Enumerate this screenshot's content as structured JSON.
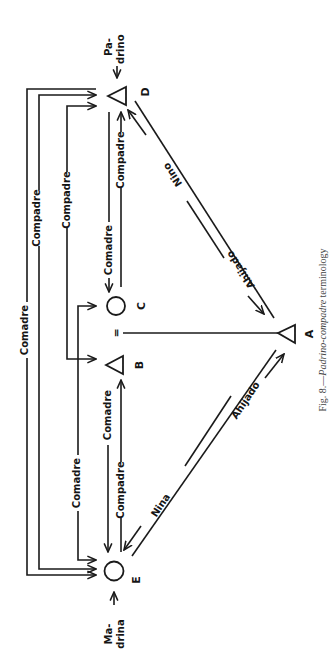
{
  "figure": {
    "caption_prefix": "Fig. 8.—",
    "caption_italic": "Padrino-compadre",
    "caption_suffix": " terminology"
  },
  "nodes": {
    "A": {
      "label": "A",
      "shape": "triangle"
    },
    "B": {
      "label": "B",
      "shape": "triangle"
    },
    "C": {
      "label": "C",
      "shape": "circle"
    },
    "D": {
      "label": "D",
      "shape": "triangle",
      "role_line1": "Pa-",
      "role_line2": "drino"
    },
    "E": {
      "label": "E",
      "shape": "circle",
      "role_line1": "Ma-",
      "role_line2": "drina"
    }
  },
  "marriage_symbol": "=",
  "edges": {
    "d_e_outer": "Comadre",
    "d_e_middle": "Compadre",
    "d_b": "Compadre",
    "c_e": "Comadre",
    "c_d": "Comadre",
    "d_c": "Compadre",
    "b_e_comadre": "Comadre",
    "e_b_compadre": "Compadre",
    "d_a_nino": "Nino",
    "a_d_ahijado": "Ahijado",
    "e_a_nina": "Nina",
    "a_e_ahijado": "Ahijado"
  }
}
